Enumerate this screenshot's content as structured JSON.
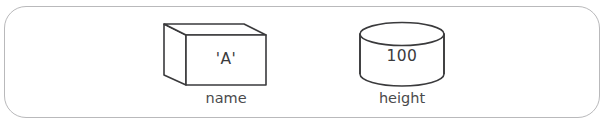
{
  "diagram": {
    "frame": {
      "name": "rounded-container",
      "border_color": "#b9b9bb",
      "background_color": "#ffffff"
    },
    "stroke_color": "#3a3a3c",
    "text_color": "#3b3b3d",
    "shapes": [
      {
        "id": "box",
        "kind": "cube",
        "value": "'A'",
        "label": "name"
      },
      {
        "id": "cylinder",
        "kind": "cylinder",
        "value": "100",
        "label": "height"
      }
    ]
  }
}
